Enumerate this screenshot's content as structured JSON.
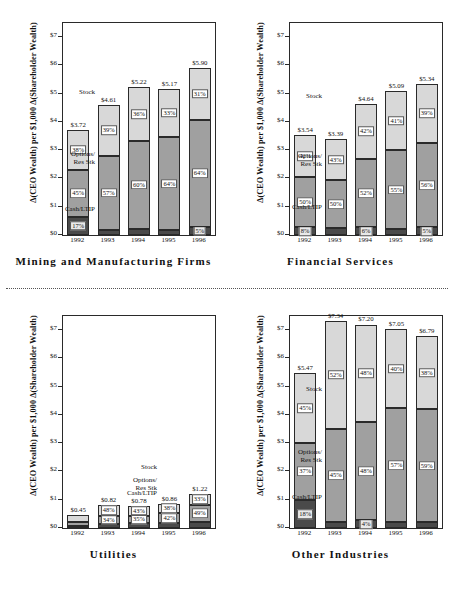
{
  "figure": {
    "axis_title_y": "Δ(CEO Wealth) per $1,000 Δ(Shareholder Wealth)",
    "ytick_labels": [
      "$0",
      "$1",
      "$2",
      "$3",
      "$4",
      "$5",
      "$6",
      "$7"
    ],
    "series_labels": {
      "stock": "Stock",
      "options": "Options/",
      "options2": "Res Stk",
      "cash": "Cash/LTIP"
    },
    "colors": {
      "stock": "#d8d8d8",
      "options": "#a0a0a0",
      "cash": "#4a4a4a",
      "frame": "#2a2a2a"
    }
  },
  "chart_data": [
    {
      "type": "bar",
      "title": "Mining  and  Manufacturing  Firms",
      "xlabel": "",
      "ylabel": "Δ(CEO Wealth) per $1,000 Δ(Shareholder Wealth)",
      "ylim": [
        0,
        7.5
      ],
      "grid": false,
      "legend": [
        "Stock",
        "Options/ Res Stk",
        "Cash/LTIP"
      ],
      "categories": [
        "1992",
        "1993",
        "1994",
        "1995",
        "1996"
      ],
      "totals": [
        "$3.72",
        "$4.61",
        "$5.22",
        "$5.17",
        "$5.90"
      ],
      "total_values": [
        3.72,
        4.61,
        5.22,
        5.17,
        5.9
      ],
      "series": [
        {
          "name": "Stock",
          "pct": [
            "38%",
            "39%",
            "36%",
            "33%",
            "31%"
          ],
          "values": [
            1.41,
            1.8,
            1.88,
            1.71,
            1.83
          ]
        },
        {
          "name": "Options/Res Stk",
          "pct": [
            "45%",
            "57%",
            "60%",
            "64%",
            "64%"
          ],
          "values": [
            1.67,
            2.63,
            3.13,
            3.31,
            3.78
          ]
        },
        {
          "name": "Cash/LTIP",
          "pct": [
            "17%",
            "4%",
            "4%",
            "3%",
            "5%"
          ],
          "values": [
            0.64,
            0.18,
            0.21,
            0.16,
            0.3
          ]
        }
      ]
    },
    {
      "type": "bar",
      "title": "Financial  Services",
      "xlabel": "",
      "ylabel": "Δ(CEO Wealth) per $1,000 Δ(Shareholder Wealth)",
      "ylim": [
        0,
        7.5
      ],
      "grid": false,
      "legend": [
        "Stock",
        "Options/ Res Stk",
        "Cash/LTIP"
      ],
      "categories": [
        "1992",
        "1993",
        "1994",
        "1995",
        "1996"
      ],
      "totals": [
        "$3.54",
        "$3.39",
        "$4.64",
        "$5.09",
        "$5.34"
      ],
      "total_values": [
        3.54,
        3.39,
        4.64,
        5.09,
        5.34
      ],
      "series": [
        {
          "name": "Stock",
          "pct": [
            "42%",
            "43%",
            "42%",
            "41%",
            "39%"
          ],
          "values": [
            1.49,
            1.46,
            1.95,
            2.09,
            2.08
          ]
        },
        {
          "name": "Options/Res Stk",
          "pct": [
            "50%",
            "50%",
            "52%",
            "55%",
            "56%"
          ],
          "values": [
            1.77,
            1.7,
            2.41,
            2.8,
            2.99
          ]
        },
        {
          "name": "Cash/LTIP",
          "pct": [
            "8%",
            "7%",
            "6%",
            "4%",
            "5%"
          ],
          "values": [
            0.28,
            0.24,
            0.28,
            0.2,
            0.27
          ]
        }
      ]
    },
    {
      "type": "bar",
      "title": "Utilities",
      "xlabel": "",
      "ylabel": "Δ(CEO Wealth) per $1,000 Δ(Shareholder Wealth)",
      "ylim": [
        0,
        7.5
      ],
      "grid": false,
      "legend": [
        "Stock",
        "Options/ Res Stk",
        "Cash/LTIP"
      ],
      "categories": [
        "1992",
        "1993",
        "1994",
        "1995",
        "1996"
      ],
      "totals": [
        "$0.45",
        "$0.82",
        "$0.78",
        "$0.86",
        "$1.22"
      ],
      "total_values": [
        0.45,
        0.82,
        0.78,
        0.86,
        1.22
      ],
      "series": [
        {
          "name": "Stock",
          "pct": [
            "53%",
            "48%",
            "43%",
            "38%",
            "33%"
          ],
          "values": [
            0.24,
            0.39,
            0.34,
            0.33,
            0.4
          ]
        },
        {
          "name": "Options/Res Stk",
          "pct": [
            "33%",
            "34%",
            "35%",
            "42%",
            "49%"
          ],
          "values": [
            0.15,
            0.28,
            0.27,
            0.36,
            0.6
          ]
        },
        {
          "name": "Cash/LTIP",
          "pct": [
            "14%",
            "18%",
            "22%",
            "20%",
            "18%"
          ],
          "values": [
            0.06,
            0.15,
            0.17,
            0.17,
            0.22
          ]
        }
      ]
    },
    {
      "type": "bar",
      "title": "Other  Industries",
      "xlabel": "",
      "ylabel": "Δ(CEO Wealth) per $1,000 Δ(Shareholder Wealth)",
      "ylim": [
        0,
        7.5
      ],
      "grid": false,
      "legend": [
        "Stock",
        "Options/ Res Stk",
        "Cash/LTIP"
      ],
      "categories": [
        "1992",
        "1993",
        "1994",
        "1995",
        "1996"
      ],
      "totals": [
        "$5.47",
        "$7.34",
        "$7.20",
        "$7.05",
        "$6.79"
      ],
      "total_values": [
        5.47,
        7.34,
        7.2,
        7.05,
        6.79
      ],
      "series": [
        {
          "name": "Stock",
          "pct": [
            "45%",
            "52%",
            "48%",
            "40%",
            "38%"
          ],
          "values": [
            2.46,
            3.82,
            3.46,
            2.82,
            2.58
          ]
        },
        {
          "name": "Options/Res Stk",
          "pct": [
            "37%",
            "45%",
            "48%",
            "57%",
            "59%"
          ],
          "values": [
            2.02,
            3.3,
            3.46,
            4.02,
            4.01
          ]
        },
        {
          "name": "Cash/LTIP",
          "pct": [
            "18%",
            "3%",
            "4%",
            "3%",
            "3%"
          ],
          "values": [
            0.99,
            0.22,
            0.28,
            0.21,
            0.2
          ]
        }
      ]
    }
  ]
}
